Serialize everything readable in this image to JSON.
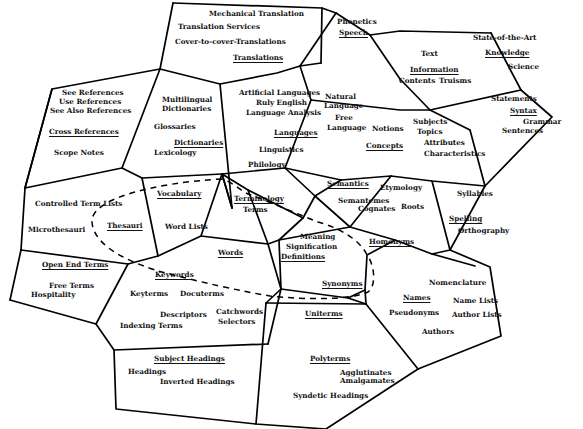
{
  "diagram": {
    "type": "concept-cell-map",
    "colors": {
      "line": "#000000",
      "text": "#111111",
      "background": "#ffffff"
    },
    "edges": [
      "M173,3 L322,8 L336,13",
      "M173,3 L160,69",
      "M322,8 L321,63",
      "M336,13 L370,35 L400,31 L491,33",
      "M336,13 L300,66",
      "M160,69 L220,84 L277,73 L300,66",
      "M160,69 L52,89 L25,188",
      "M321,63 L300,66",
      "M300,66 L311,100",
      "M491,33 L521,90",
      "M370,35 L400,79",
      "M400,79 L430,110 L470,130",
      "M311,100 L400,110 L430,110",
      "M430,110 L521,90",
      "M521,90 L552,117 L485,186",
      "M485,186 L470,130",
      "M220,84 L232,208",
      "M160,69 L122,168",
      "M52,89 L25,188",
      "M25,188 L122,168 L142,178 L222,174",
      "M311,100 L285,168",
      "M285,168 L222,174",
      "M222,174 L232,208",
      "M285,168 L315,196",
      "M285,168 L341,180",
      "M341,180 L391,176 L432,181 L485,186",
      "M222,174 L232,208",
      "M142,178 L158,256",
      "M158,256 L201,236 L222,174",
      "M222,174 L248,190 L268,244",
      "M248,190 L303,218 L315,196",
      "M315,196 L341,180",
      "M315,196 L350,227",
      "M25,188 L21,250",
      "M21,250 L128,264 L158,256",
      "M128,264 L96,324 L10,300",
      "M10,300 L21,250",
      "M96,324 L114,350 L268,344",
      "M268,344 L281,289",
      "M201,236 L268,244 L281,289",
      "M268,244 L279,240",
      "M279,240 L350,227 L395,240 L432,254 L475,266",
      "M303,218 L279,240",
      "M350,227 L391,176",
      "M432,181 L450,250",
      "M432,254 L450,250 L485,186",
      "M450,250 L490,267 L501,336 L418,369",
      "M279,240 L281,289",
      "M281,289 L348,298 L365,290",
      "M365,290 L367,255 L395,240",
      "M348,298 L366,304",
      "M281,289 L266,303",
      "M114,350 L116,409 L256,424 L326,429 L418,369",
      "M256,424 L266,303",
      "M266,303 L366,304 L418,369",
      "M365,290 L366,304"
    ],
    "dashed_boundary": "M222,179 C150,183 90,200 92,222 C94,250 140,265 158,271 C200,282 240,291 270,296 C310,300 350,300 368,292 C378,284 373,262 367,255 C360,240 340,228 318,222 C300,215 270,202 248,194 C240,190 232,182 222,179",
    "labels": [
      {
        "id": "mechanical-translation",
        "text": "Mechanical Translation",
        "x": 209,
        "y": 14,
        "heading": false
      },
      {
        "id": "translation-services",
        "text": "Translation Services",
        "x": 178,
        "y": 27,
        "heading": false
      },
      {
        "id": "cover-to-cover",
        "text": "Cover-to-cover-Translations",
        "x": 175,
        "y": 42,
        "heading": false
      },
      {
        "id": "translations",
        "text": "Translations",
        "x": 233,
        "y": 58,
        "heading": true
      },
      {
        "id": "phonetics",
        "text": "Phonetics",
        "x": 337,
        "y": 22,
        "heading": false
      },
      {
        "id": "speech",
        "text": "Speech",
        "x": 339,
        "y": 33,
        "heading": true
      },
      {
        "id": "state-of-the-art",
        "text": "State-of-the-Art",
        "x": 473,
        "y": 38,
        "heading": false
      },
      {
        "id": "knowledge",
        "text": "Knowledge",
        "x": 485,
        "y": 53,
        "heading": true
      },
      {
        "id": "science",
        "text": "Science",
        "x": 508,
        "y": 67,
        "heading": false
      },
      {
        "id": "text",
        "text": "Text",
        "x": 421,
        "y": 54,
        "heading": false
      },
      {
        "id": "information",
        "text": "Information",
        "x": 410,
        "y": 70,
        "heading": true
      },
      {
        "id": "contents",
        "text": "Contents",
        "x": 399,
        "y": 81,
        "heading": false
      },
      {
        "id": "truisms",
        "text": "Truisms",
        "x": 439,
        "y": 81,
        "heading": false
      },
      {
        "id": "see-references",
        "text": "See References",
        "x": 62,
        "y": 93,
        "heading": false
      },
      {
        "id": "use-references",
        "text": "Use References",
        "x": 59,
        "y": 102,
        "heading": false
      },
      {
        "id": "see-also-references",
        "text": "See Also References",
        "x": 50,
        "y": 111,
        "heading": false
      },
      {
        "id": "cross-references",
        "text": "Cross References",
        "x": 49,
        "y": 132,
        "heading": true
      },
      {
        "id": "scope-notes",
        "text": "Scope  Notes",
        "x": 54,
        "y": 153,
        "heading": false
      },
      {
        "id": "multilingual",
        "text": "Multilingual",
        "x": 162,
        "y": 100,
        "heading": false
      },
      {
        "id": "dictionaries-1",
        "text": "Dictionaries",
        "x": 162,
        "y": 109,
        "heading": false
      },
      {
        "id": "glossaries",
        "text": "Glossaries",
        "x": 154,
        "y": 127,
        "heading": false
      },
      {
        "id": "dictionaries",
        "text": "Dictionaries",
        "x": 174,
        "y": 143,
        "heading": true
      },
      {
        "id": "lexicology",
        "text": "Lexicology",
        "x": 154,
        "y": 153,
        "heading": false
      },
      {
        "id": "artificial-languages",
        "text": "Artificial Languages",
        "x": 239,
        "y": 93,
        "heading": false
      },
      {
        "id": "ruly-english",
        "text": "Ruly English",
        "x": 256,
        "y": 103,
        "heading": false
      },
      {
        "id": "language-analysis",
        "text": "Language Analysis",
        "x": 246,
        "y": 113,
        "heading": false
      },
      {
        "id": "natural-language-1",
        "text": "Natural",
        "x": 325,
        "y": 97,
        "heading": false
      },
      {
        "id": "natural-language-2",
        "text": "Language",
        "x": 324,
        "y": 106,
        "heading": false
      },
      {
        "id": "free-language-1",
        "text": "Free",
        "x": 335,
        "y": 118,
        "heading": false
      },
      {
        "id": "free-language-2",
        "text": "Language",
        "x": 327,
        "y": 128,
        "heading": false
      },
      {
        "id": "languages",
        "text": "Languages",
        "x": 274,
        "y": 133,
        "heading": true
      },
      {
        "id": "linguistics",
        "text": "Linguistics",
        "x": 259,
        "y": 150,
        "heading": false
      },
      {
        "id": "philology",
        "text": "Philology",
        "x": 248,
        "y": 165,
        "heading": false
      },
      {
        "id": "notions",
        "text": "Notions",
        "x": 372,
        "y": 129,
        "heading": false
      },
      {
        "id": "subjects",
        "text": "Subjects",
        "x": 413,
        "y": 122,
        "heading": false
      },
      {
        "id": "topics",
        "text": "Topics",
        "x": 417,
        "y": 132,
        "heading": false
      },
      {
        "id": "concepts",
        "text": "Concepts",
        "x": 366,
        "y": 146,
        "heading": true
      },
      {
        "id": "attributes",
        "text": "Attributes",
        "x": 424,
        "y": 143,
        "heading": false
      },
      {
        "id": "characteristics",
        "text": "Characteristics",
        "x": 424,
        "y": 154,
        "heading": false
      },
      {
        "id": "statements",
        "text": "Statements",
        "x": 491,
        "y": 99,
        "heading": false
      },
      {
        "id": "syntax",
        "text": "Syntax",
        "x": 510,
        "y": 111,
        "heading": true
      },
      {
        "id": "grammar",
        "text": "Grammar",
        "x": 523,
        "y": 122,
        "heading": false
      },
      {
        "id": "sentences",
        "text": "Sentences",
        "x": 502,
        "y": 131,
        "heading": false
      },
      {
        "id": "controlled-term-lists",
        "text": "Controlled Term Lists",
        "x": 35,
        "y": 204,
        "heading": false
      },
      {
        "id": "microthesauri",
        "text": "Microthesauri",
        "x": 28,
        "y": 230,
        "heading": false
      },
      {
        "id": "thesauri",
        "text": "Thesauri",
        "x": 107,
        "y": 226,
        "heading": true
      },
      {
        "id": "vocabulary",
        "text": "Vocabulary",
        "x": 157,
        "y": 194,
        "heading": true
      },
      {
        "id": "word-lists",
        "text": "Word Lists",
        "x": 165,
        "y": 227,
        "heading": false
      },
      {
        "id": "terminology",
        "text": "Terminology",
        "x": 234,
        "y": 199,
        "heading": true
      },
      {
        "id": "terms",
        "text": "Terms",
        "x": 243,
        "y": 210,
        "heading": false
      },
      {
        "id": "words",
        "text": "Words",
        "x": 218,
        "y": 253,
        "heading": true
      },
      {
        "id": "semantics",
        "text": "Semantics",
        "x": 327,
        "y": 184,
        "heading": true
      },
      {
        "id": "etymology",
        "text": "Etymology",
        "x": 380,
        "y": 188,
        "heading": false
      },
      {
        "id": "semantemes",
        "text": "Semantemes",
        "x": 338,
        "y": 201,
        "heading": false
      },
      {
        "id": "cognates",
        "text": "Cognates",
        "x": 358,
        "y": 209,
        "heading": false
      },
      {
        "id": "roots",
        "text": "Roots",
        "x": 401,
        "y": 207,
        "heading": false
      },
      {
        "id": "syllables",
        "text": "Syllables",
        "x": 457,
        "y": 194,
        "heading": false
      },
      {
        "id": "spelling",
        "text": "Spelling",
        "x": 449,
        "y": 219,
        "heading": true
      },
      {
        "id": "orthography",
        "text": "Orthography",
        "x": 458,
        "y": 231,
        "heading": false
      },
      {
        "id": "meaning",
        "text": "Meaning",
        "x": 300,
        "y": 237,
        "heading": false
      },
      {
        "id": "signification",
        "text": "Signification",
        "x": 286,
        "y": 247,
        "heading": false
      },
      {
        "id": "definitions",
        "text": "Definitions",
        "x": 281,
        "y": 257,
        "heading": true
      },
      {
        "id": "homonyms",
        "text": "Homonyms",
        "x": 369,
        "y": 242,
        "heading": true
      },
      {
        "id": "open-end-terms",
        "text": "Open End Terms",
        "x": 42,
        "y": 265,
        "heading": true
      },
      {
        "id": "free-terms",
        "text": "Free Terms",
        "x": 49,
        "y": 286,
        "heading": false
      },
      {
        "id": "hospitality",
        "text": "Hospitality",
        "x": 31,
        "y": 295,
        "heading": false
      },
      {
        "id": "keywords",
        "text": "Keywords",
        "x": 155,
        "y": 275,
        "heading": true
      },
      {
        "id": "keyterms",
        "text": "Keyterms",
        "x": 130,
        "y": 294,
        "heading": false
      },
      {
        "id": "docuterms",
        "text": "Docuterms",
        "x": 180,
        "y": 294,
        "heading": false
      },
      {
        "id": "descriptors",
        "text": "Descriptors",
        "x": 160,
        "y": 315,
        "heading": false
      },
      {
        "id": "catchwords",
        "text": "Catchwords",
        "x": 216,
        "y": 312,
        "heading": false
      },
      {
        "id": "selectors",
        "text": "Selectors",
        "x": 218,
        "y": 322,
        "heading": false
      },
      {
        "id": "indexing-terms",
        "text": "Indexing Terms",
        "x": 120,
        "y": 326,
        "heading": false
      },
      {
        "id": "synonyms",
        "text": "Synonyms",
        "x": 322,
        "y": 284,
        "heading": true
      },
      {
        "id": "uniterms",
        "text": "Uniterms",
        "x": 305,
        "y": 314,
        "heading": true
      },
      {
        "id": "nomenclature",
        "text": "Nomenclature",
        "x": 429,
        "y": 283,
        "heading": false
      },
      {
        "id": "names",
        "text": "Names",
        "x": 403,
        "y": 298,
        "heading": true
      },
      {
        "id": "name-lists",
        "text": "Name Lists",
        "x": 453,
        "y": 301,
        "heading": false
      },
      {
        "id": "pseudonyms",
        "text": "Pseudonyms",
        "x": 389,
        "y": 313,
        "heading": false
      },
      {
        "id": "author-lists",
        "text": "Author Lists",
        "x": 452,
        "y": 315,
        "heading": false
      },
      {
        "id": "authors",
        "text": "Authors",
        "x": 422,
        "y": 332,
        "heading": false
      },
      {
        "id": "subject-headings",
        "text": "Subject Headings",
        "x": 154,
        "y": 359,
        "heading": true
      },
      {
        "id": "headings",
        "text": "Headings",
        "x": 128,
        "y": 372,
        "heading": false
      },
      {
        "id": "inverted-headings",
        "text": "Inverted Headings",
        "x": 160,
        "y": 382,
        "heading": false
      },
      {
        "id": "polyterms",
        "text": "Polyterms",
        "x": 310,
        "y": 359,
        "heading": true
      },
      {
        "id": "agglutinates",
        "text": "Agglutinates",
        "x": 340,
        "y": 373,
        "heading": false
      },
      {
        "id": "amalgamates",
        "text": "Amalgamates",
        "x": 340,
        "y": 381,
        "heading": false
      },
      {
        "id": "syndetic-headings",
        "text": "Syndetic Headings",
        "x": 293,
        "y": 396,
        "heading": false
      }
    ]
  }
}
